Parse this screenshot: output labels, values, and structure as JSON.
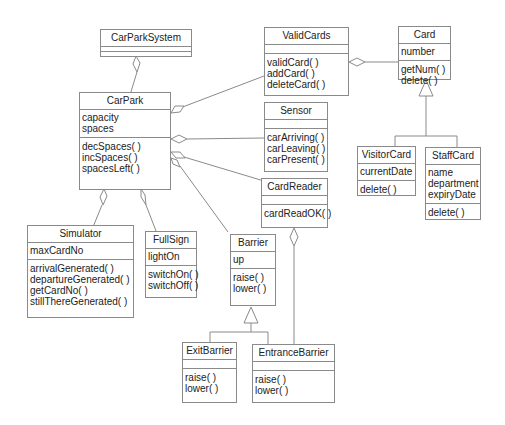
{
  "classes": {
    "carParkSystem": {
      "name": "CarParkSystem",
      "attributes": [],
      "operations": []
    },
    "carPark": {
      "name": "CarPark",
      "attributes": [
        "capacity",
        "spaces"
      ],
      "operations": [
        "decSpaces( )",
        "incSpaces( )",
        "spacesLeft( )"
      ]
    },
    "validCards": {
      "name": "ValidCards",
      "attributes": [],
      "operations": [
        "validCard( )",
        "addCard( )",
        "deleteCard( )"
      ]
    },
    "card": {
      "name": "Card",
      "attributes": [
        "number"
      ],
      "operations": [
        "getNum( )",
        "delete( )"
      ]
    },
    "sensor": {
      "name": "Sensor",
      "attributes": [],
      "operations": [
        "carArriving( )",
        "carLeaving( )",
        "carPresent( )"
      ]
    },
    "cardReader": {
      "name": "CardReader",
      "attributes": [],
      "operations": [
        "cardReadOK( )"
      ]
    },
    "visitorCard": {
      "name": "VisitorCard",
      "attributes": [
        "currentDate"
      ],
      "operations": [
        "delete( )"
      ]
    },
    "staffCard": {
      "name": "StaffCard",
      "attributes": [
        "name",
        "department",
        "expiryDate"
      ],
      "operations": [
        "delete( )"
      ]
    },
    "simulator": {
      "name": "Simulator",
      "attributes": [
        "maxCardNo"
      ],
      "operations": [
        "arrivalGenerated( )",
        "departureGenerated( )",
        "getCardNo( )",
        "stillThereGenerated( )"
      ]
    },
    "fullSign": {
      "name": "FullSign",
      "attributes": [
        "lightOn"
      ],
      "operations": [
        "switchOn( )",
        "switchOff( )"
      ]
    },
    "barrier": {
      "name": "Barrier",
      "attributes": [
        "up"
      ],
      "operations": [
        "raise( )",
        "lower( )"
      ]
    },
    "exitBarrier": {
      "name": "ExitBarrier",
      "attributes": [],
      "operations": [
        "raise( )",
        "lower( )"
      ]
    },
    "entranceBarrier": {
      "name": "EntranceBarrier",
      "attributes": [],
      "operations": [
        "raise( )",
        "lower( )"
      ]
    }
  },
  "relationships": [
    {
      "type": "aggregation",
      "whole": "CarParkSystem",
      "part": "CarPark"
    },
    {
      "type": "aggregation",
      "whole": "CarPark",
      "part": "ValidCards"
    },
    {
      "type": "aggregation",
      "whole": "CarPark",
      "part": "Sensor"
    },
    {
      "type": "aggregation",
      "whole": "CarPark",
      "part": "CardReader"
    },
    {
      "type": "aggregation",
      "whole": "CarPark",
      "part": "Barrier"
    },
    {
      "type": "aggregation",
      "whole": "CarPark",
      "part": "Simulator"
    },
    {
      "type": "aggregation",
      "whole": "CarPark",
      "part": "FullSign"
    },
    {
      "type": "aggregation",
      "whole": "ValidCards",
      "part": "Card"
    },
    {
      "type": "aggregation",
      "whole": "CardReader",
      "part": "EntranceBarrier"
    },
    {
      "type": "generalization",
      "parent": "Card",
      "children": [
        "VisitorCard",
        "StaffCard"
      ]
    },
    {
      "type": "generalization",
      "parent": "Barrier",
      "children": [
        "ExitBarrier",
        "EntranceBarrier"
      ]
    }
  ],
  "colors": {
    "line": "#8a8a8a",
    "text": "#222222",
    "background": "#ffffff"
  }
}
